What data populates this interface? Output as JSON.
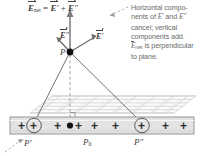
{
  "figure": {
    "equation": {
      "lhs_symbol": "E",
      "lhs_sub": "net",
      "eq": "=",
      "term1": "E",
      "term1_prime": "′",
      "plus": "+",
      "term2": "E",
      "term2_prime": "″"
    },
    "annotation": {
      "line1": "Horizontal compo-",
      "line2_pre": "nents of ",
      "line2_e1": "E",
      "line2_prime1": "′",
      "line2_mid": " and ",
      "line2_e2": "E",
      "line2_prime2": "″",
      "line3": "cancel; vertical",
      "line4": "components add.",
      "line5_e": "E",
      "line5_sub": "net",
      "line5_rest": " is perpendicular",
      "line6": "to plane."
    },
    "vector_labels": {
      "left": "E",
      "left_prime": "″",
      "right": "E",
      "right_prime": "′"
    },
    "point_labels": {
      "p": "P",
      "p_prime": "P′",
      "p_zero": "P",
      "p_zero_sub": "0",
      "p_double_prime": "P″"
    },
    "charges": {
      "symbol": "+",
      "count": 9,
      "circled_indices": [
        1,
        6
      ],
      "row_label": "positively-charged-plane-strip"
    },
    "colors": {
      "ink": "#3d3d3d",
      "annotation_text": "#6b6b6b",
      "strip_fill": "#e3e3e3",
      "strip_stroke": "#8a8a8a",
      "plane_grid": "#c9c9c9",
      "ray_line": "#5a5a5a",
      "dashed_line": "#7a7a7a",
      "background": "#ffffff"
    }
  }
}
